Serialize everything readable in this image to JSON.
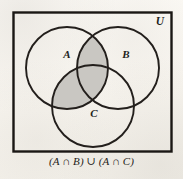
{
  "figure": {
    "caption": "(A ∩ B) ∪ (A ∩ C)",
    "universe_label": "U",
    "set_labels": {
      "a": "A",
      "b": "B",
      "c": "C"
    },
    "colors": {
      "paper": "#faf8f4",
      "ink": "#231f1c",
      "shade": "#c9c7c2",
      "rect_border": "#1a1714"
    },
    "venn": {
      "type": "three-set-venn",
      "shaded_expression": "(A ∩ B) ∪ (A ∩ C)",
      "universe": {
        "x": 13,
        "y": 12,
        "width": 159,
        "height": 140
      },
      "circles": [
        {
          "id": "A",
          "label": "A",
          "cx": 67,
          "cy": 68,
          "r": 41,
          "label_x": 67,
          "label_y": 58
        },
        {
          "id": "B",
          "label": "B",
          "cx": 118,
          "cy": 68,
          "r": 41,
          "label_x": 126,
          "label_y": 58
        },
        {
          "id": "C",
          "label": "C",
          "cx": 93,
          "cy": 106,
          "r": 41,
          "label_x": 94,
          "label_y": 117
        }
      ],
      "regions": [
        {
          "id": "A-only",
          "shaded": false
        },
        {
          "id": "B-only",
          "shaded": false
        },
        {
          "id": "C-only",
          "shaded": false
        },
        {
          "id": "A-and-B",
          "shaded": true
        },
        {
          "id": "A-and-C",
          "shaded": true
        },
        {
          "id": "B-and-C",
          "shaded": false
        },
        {
          "id": "A-and-B-and-C",
          "shaded": true
        },
        {
          "id": "outside",
          "shaded": false
        }
      ],
      "universe_label_x": 160,
      "universe_label_y": 25
    }
  }
}
